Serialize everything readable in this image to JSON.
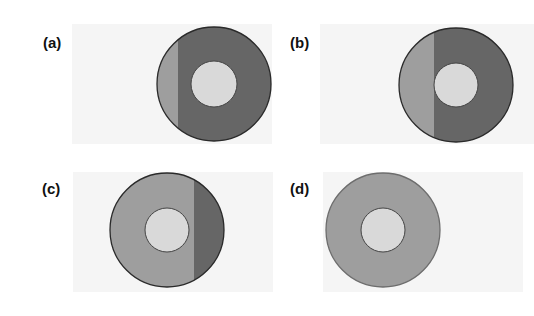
{
  "figure": {
    "colors": {
      "light_segment": "#9e9e9e",
      "dark_segment": "#666666",
      "inner_disc": "#d9d9d9",
      "outline": "#2a2a2a",
      "panel_background": "#f5f5f5"
    },
    "panels": [
      {
        "label": "(a)",
        "id": "a",
        "cx": 214,
        "cy": 84,
        "r": 57,
        "inner_r": 23,
        "split_x": 178,
        "left_fill": "light",
        "right_fill": "dark",
        "label_x": 43,
        "label_y": 34,
        "bg": {
          "x": 72,
          "y": 24,
          "w": 200,
          "h": 120
        }
      },
      {
        "label": "(b)",
        "id": "b",
        "cx": 456,
        "cy": 85,
        "r": 57,
        "inner_r": 22,
        "split_x": 434,
        "left_fill": "light",
        "right_fill": "dark",
        "label_x": 290,
        "label_y": 34,
        "bg": {
          "x": 320,
          "y": 24,
          "w": 214,
          "h": 120
        }
      },
      {
        "label": "(c)",
        "id": "c",
        "cx": 167,
        "cy": 230,
        "r": 57,
        "inner_r": 22,
        "split_x": 194,
        "left_fill": "light",
        "right_fill": "dark",
        "label_x": 42,
        "label_y": 180,
        "bg": {
          "x": 73,
          "y": 172,
          "w": 200,
          "h": 120
        }
      },
      {
        "label": "(d)",
        "id": "d",
        "cx": 383,
        "cy": 230,
        "r": 57,
        "inner_r": 22,
        "split_x": null,
        "left_fill": "light",
        "right_fill": "light",
        "label_x": 290,
        "label_y": 180,
        "bg": {
          "x": 323,
          "y": 172,
          "w": 200,
          "h": 120
        }
      }
    ]
  }
}
